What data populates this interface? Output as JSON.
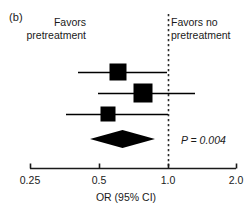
{
  "figure": {
    "panel_label": "(b)",
    "axis_title": "OR (95% CI)",
    "p_value_text": "P = 0.004",
    "favors_left": "Favors\npretreatment",
    "favors_right": "Favors no\npretreatment",
    "marker_color": "#000000",
    "axis_color": "#1a1a1a",
    "background_color": "#ffffff"
  },
  "chart_data": {
    "type": "forest",
    "title": "(b)",
    "xlabel": "OR (95% CI)",
    "ylabel": "",
    "x_scale": "log",
    "xlim": [
      0.25,
      2.0
    ],
    "ticks": [
      {
        "value": 0.25,
        "label": "0.25",
        "x_px": 30
      },
      {
        "value": 0.5,
        "label": "0.5",
        "x_px": 99
      },
      {
        "value": 1.0,
        "label": "1.0",
        "x_px": 168
      },
      {
        "value": 2.0,
        "label": "2.0",
        "x_px": 236
      }
    ],
    "null_line": 1.0,
    "grid": false,
    "legend": false,
    "annotations": [
      {
        "text": "Favors pretreatment",
        "side": "left",
        "relative_to": "null-line"
      },
      {
        "text": "Favors no pretreatment",
        "side": "right",
        "relative_to": "null-line"
      },
      {
        "text": "P = 0.004",
        "side": "right",
        "relative_to": "summary-row"
      }
    ],
    "studies": [
      {
        "index": 1,
        "or": 0.67,
        "ci_low": 0.38,
        "ci_high": 0.99,
        "y_px": 72,
        "marker_size_px": 17,
        "marker_x_px": 118,
        "ci_low_x_px": 78,
        "ci_high_x_px": 167
      },
      {
        "index": 2,
        "or": 0.79,
        "ci_low": 0.5,
        "ci_high": 1.3,
        "y_px": 93,
        "marker_size_px": 19,
        "marker_x_px": 143,
        "ci_low_x_px": 98,
        "ci_high_x_px": 195
      },
      {
        "index": 3,
        "or": 0.58,
        "ci_low": 0.33,
        "ci_high": 1.0,
        "y_px": 114,
        "marker_size_px": 15,
        "marker_x_px": 108,
        "ci_low_x_px": 66,
        "ci_high_x_px": 168
      }
    ],
    "summary": {
      "or": 0.63,
      "ci_low": 0.45,
      "ci_high": 0.88,
      "p_value": 0.004,
      "y_px": 139,
      "left_x_px": 90,
      "right_x_px": 155,
      "half_height_px": 9
    },
    "axis": {
      "y_px": 168,
      "x_start_px": 30,
      "x_end_px": 236,
      "tick_length_px": 5
    }
  }
}
